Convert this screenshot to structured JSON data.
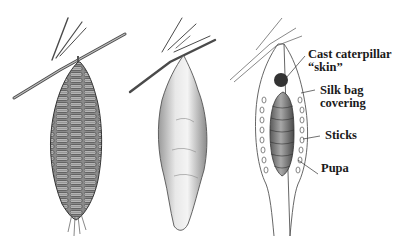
{
  "figure": {
    "panels": [
      {
        "id": "bag-with-sticks",
        "description": "Bagworm bag covered with sticks hanging from twig"
      },
      {
        "id": "bag-silk",
        "description": "Silk bag hanging from twig"
      },
      {
        "id": "bag-cutaway",
        "description": "Cutaway view of bag showing pupa inside"
      }
    ],
    "labels": {
      "cast_skin_line1": "Cast caterpillar",
      "cast_skin_line2": "“skin”",
      "silk_line1": "Silk bag",
      "silk_line2": "covering",
      "sticks": "Sticks",
      "pupa": "Pupa"
    },
    "colors": {
      "ink": "#3a3a3a",
      "shade_dark": "#5a5a5a",
      "shade_mid": "#9a9a9a",
      "shade_light": "#cfcfcf",
      "background": "#ffffff"
    }
  }
}
